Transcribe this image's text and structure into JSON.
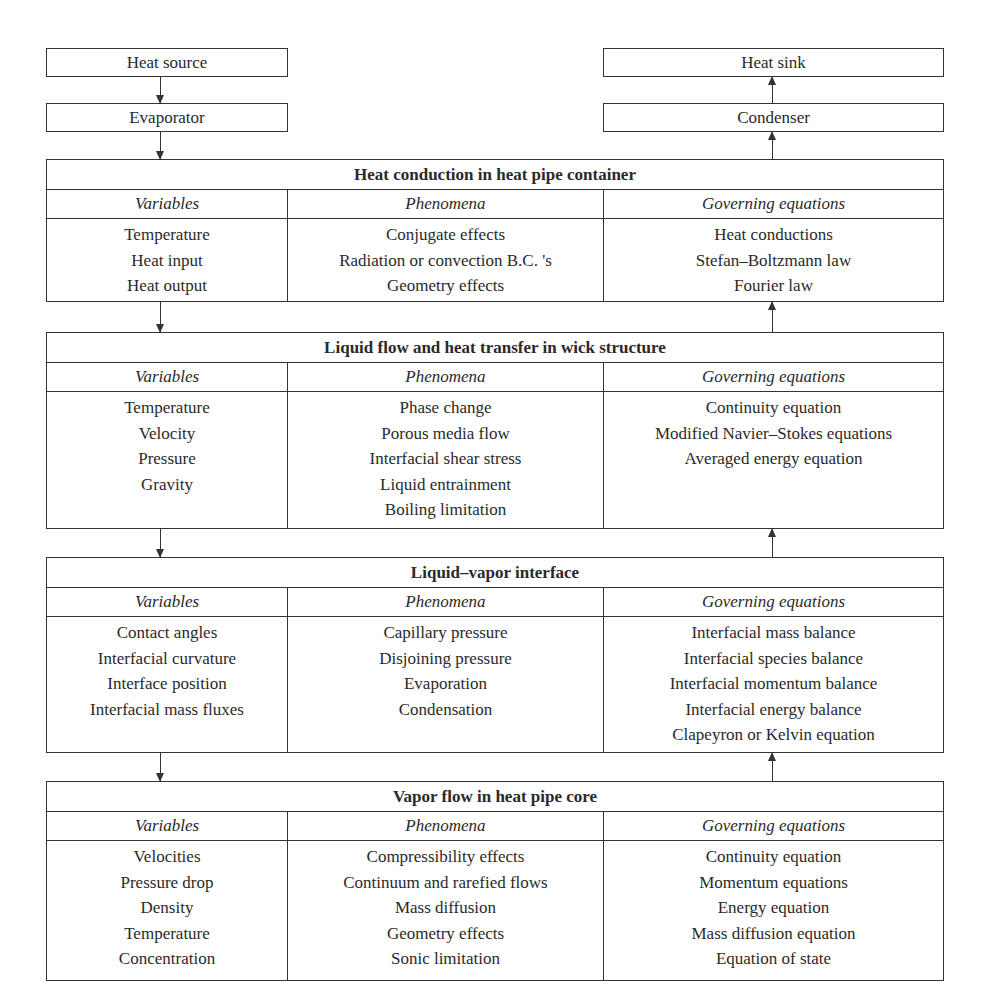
{
  "left_chain": {
    "heat_source": "Heat source",
    "evaporator": "Evaporator"
  },
  "right_chain": {
    "heat_sink": "Heat sink",
    "condenser": "Condenser"
  },
  "column_headers": {
    "variables": "Variables",
    "phenomena": "Phenomena",
    "governing": "Governing equations"
  },
  "sections": [
    {
      "title": "Heat conduction in heat pipe container",
      "variables": [
        "Temperature",
        "Heat input",
        "Heat output"
      ],
      "phenomena": [
        "Conjugate effects",
        "Radiation or convection B.C. 's",
        "Geometry effects"
      ],
      "governing": [
        "Heat conductions",
        "Stefan–Boltzmann law",
        "Fourier law"
      ]
    },
    {
      "title": "Liquid flow and heat transfer in wick structure",
      "variables": [
        "Temperature",
        "Velocity",
        "Pressure",
        "Gravity"
      ],
      "phenomena": [
        "Phase change",
        "Porous media flow",
        "Interfacial shear stress",
        "Liquid entrainment",
        "Boiling  limitation"
      ],
      "governing": [
        "Continuity equation",
        "Modified Navier–Stokes equations",
        "Averaged energy equation"
      ]
    },
    {
      "title": "Liquid–vapor interface",
      "variables": [
        "Contact angles",
        "Interfacial curvature",
        "Interface position",
        "Interfacial mass fluxes"
      ],
      "phenomena": [
        "Capillary pressure",
        "Disjoining pressure",
        "Evaporation",
        "Condensation"
      ],
      "governing": [
        "Interfacial mass balance",
        "Interfacial species balance",
        "Interfacial momentum balance",
        "Interfacial energy balance",
        "Clapeyron or Kelvin equation"
      ]
    },
    {
      "title": "Vapor flow in heat pipe core",
      "variables": [
        "Velocities",
        "Pressure drop",
        "Density",
        "Temperature",
        "Concentration"
      ],
      "phenomena": [
        "Compressibility effects",
        "Continuum and rarefied flows",
        "Mass diffusion",
        "Geometry effects",
        "Sonic limitation"
      ],
      "governing": [
        "Continuity equation",
        "Momentum equations",
        "Energy equation",
        "Mass diffusion equation",
        "Equation of state"
      ]
    }
  ]
}
